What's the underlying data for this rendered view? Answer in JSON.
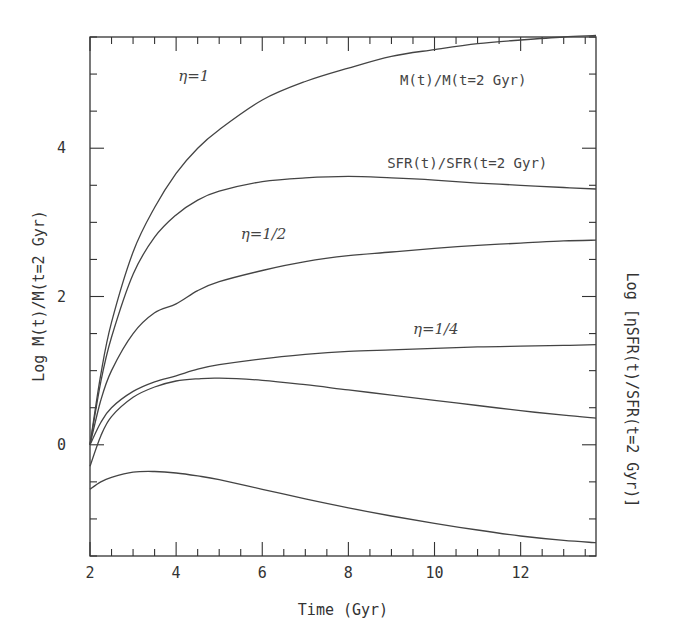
{
  "chart_data": {
    "type": "line",
    "title": "",
    "xlabel": "Time (Gyr)",
    "ylabel": "Log M(t)/M(t=2 Gyr)",
    "ylabel_right": "Log [ηSFR(t)/SFR(t=2 Gyr)]",
    "xlim": [
      2,
      13.75
    ],
    "ylim": [
      -1.5,
      5.5
    ],
    "x_major_ticks": [
      2,
      4,
      6,
      8,
      10,
      12
    ],
    "x_tick_labels": [
      "2",
      "4",
      "6",
      "8",
      "10",
      "12"
    ],
    "x_minor_step": 0.5,
    "y_major_ticks": [
      0,
      2,
      4
    ],
    "y_tick_labels": [
      "0",
      "2",
      "4"
    ],
    "y_minor_step": 0.5,
    "grid": false,
    "legend": null,
    "annotations": [
      {
        "text": "η=1",
        "x": 4.05,
        "y": 4.9,
        "style": "eta"
      },
      {
        "text": "M(t)/M(t=2 Gyr)",
        "x": 9.2,
        "y": 4.85,
        "style": "mono"
      },
      {
        "text": "SFR(t)/SFR(t=2 Gyr)",
        "x": 8.9,
        "y": 3.73,
        "style": "mono"
      },
      {
        "text": "η=1/2",
        "x": 5.5,
        "y": 2.78,
        "style": "eta"
      },
      {
        "text": "η=1/4",
        "x": 9.5,
        "y": 1.5,
        "style": "eta"
      }
    ],
    "series": [
      {
        "name": "M(t)/M(t=2 Gyr), eta=1",
        "x": [
          2,
          2.25,
          2.5,
          3,
          3.5,
          4,
          4.5,
          5,
          6,
          7,
          8,
          9,
          10,
          11,
          12,
          13,
          13.75
        ],
        "y": [
          0,
          0.95,
          1.65,
          2.6,
          3.2,
          3.66,
          4.0,
          4.25,
          4.65,
          4.9,
          5.08,
          5.24,
          5.33,
          5.41,
          5.46,
          5.5,
          5.52
        ]
      },
      {
        "name": "SFR(t)/SFR(t=2 Gyr), eta=1",
        "x": [
          2,
          2.25,
          2.5,
          3,
          3.5,
          4,
          4.5,
          5,
          6,
          7,
          8,
          9,
          10,
          11,
          12,
          13,
          13.75
        ],
        "y": [
          0,
          0.85,
          1.45,
          2.3,
          2.8,
          3.1,
          3.3,
          3.42,
          3.55,
          3.6,
          3.62,
          3.6,
          3.57,
          3.53,
          3.5,
          3.47,
          3.45
        ]
      },
      {
        "name": "M(t)/M(t=2 Gyr), eta=1/2",
        "x": [
          2,
          2.25,
          2.5,
          3,
          3.5,
          4,
          4.5,
          5,
          6,
          7,
          8,
          9,
          10,
          11,
          12,
          13,
          13.75
        ],
        "y": [
          0,
          0.6,
          1.0,
          1.5,
          1.78,
          1.9,
          2.08,
          2.2,
          2.35,
          2.47,
          2.55,
          2.6,
          2.65,
          2.69,
          2.72,
          2.75,
          2.76
        ]
      },
      {
        "name": "M(t)/M(t=2 Gyr), eta=1/4",
        "x": [
          2,
          2.25,
          2.5,
          3,
          3.5,
          4,
          4.5,
          5,
          6,
          7,
          8,
          9,
          10,
          11,
          12,
          13,
          13.75
        ],
        "y": [
          0,
          0.3,
          0.5,
          0.72,
          0.85,
          0.93,
          1.02,
          1.08,
          1.16,
          1.22,
          1.26,
          1.28,
          1.3,
          1.32,
          1.33,
          1.34,
          1.35
        ]
      },
      {
        "name": "eta SFR(t)/SFR(t=2 Gyr), eta=1/2",
        "x": [
          2,
          2.25,
          2.5,
          3,
          3.5,
          4,
          4.5,
          5,
          6,
          7,
          8,
          9,
          10,
          11,
          12,
          13,
          13.75
        ],
        "y": [
          -0.29,
          0.12,
          0.38,
          0.64,
          0.78,
          0.86,
          0.89,
          0.9,
          0.87,
          0.81,
          0.74,
          0.67,
          0.6,
          0.53,
          0.46,
          0.4,
          0.36
        ]
      },
      {
        "name": "eta SFR(t)/SFR(t=2 Gyr), eta=1/4",
        "x": [
          2,
          2.25,
          2.5,
          3,
          3.5,
          4,
          4.5,
          5,
          6,
          7,
          8,
          9,
          10,
          11,
          12,
          13,
          13.75
        ],
        "y": [
          -0.6,
          -0.5,
          -0.44,
          -0.37,
          -0.36,
          -0.38,
          -0.42,
          -0.47,
          -0.6,
          -0.73,
          -0.85,
          -0.96,
          -1.06,
          -1.15,
          -1.23,
          -1.29,
          -1.32
        ]
      }
    ]
  },
  "page": {
    "caption_fragment": "Figure caption text (cut off)"
  }
}
